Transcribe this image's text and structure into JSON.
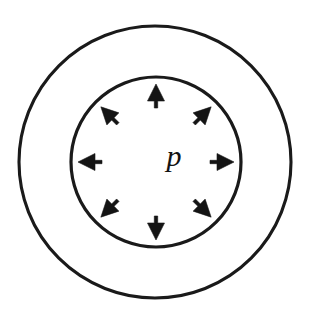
{
  "figure": {
    "kind": "diagram",
    "background_color": "#ffffff",
    "line_color": "#1a1a1a",
    "arrow_color": "#141414",
    "width": 310,
    "height": 314
  },
  "outer_circle": {
    "name": "outer wall boundary",
    "cx": 155,
    "cy": 162,
    "r": 136,
    "stroke_width": 3.1
  },
  "inner_circle": {
    "name": "inner bore boundary",
    "cx": 156,
    "cy": 162,
    "r": 85,
    "stroke_width": 3.2
  },
  "labels": [
    {
      "id": "pressure-symbol",
      "text": "p",
      "x": 174,
      "y": 166,
      "font_size": 30,
      "style": "italic-serif",
      "color": "#131313"
    }
  ],
  "arrows": {
    "count": 8,
    "direction": "radially outward",
    "meaning": "uniform internal pressure p acting on the bore wall",
    "tail_radius": 54,
    "tip_radius": 78,
    "head_length": 17,
    "head_half_width": 8.5,
    "tail_half_width": 1.7,
    "items": [
      {
        "id": "arrow-up",
        "angle_deg": 90,
        "points_toward": "up"
      },
      {
        "id": "arrow-up-right",
        "angle_deg": 45,
        "points_toward": "up-right"
      },
      {
        "id": "arrow-right",
        "angle_deg": 0,
        "points_toward": "right"
      },
      {
        "id": "arrow-down-right",
        "angle_deg": -45,
        "points_toward": "down-right"
      },
      {
        "id": "arrow-down",
        "angle_deg": -90,
        "points_toward": "down"
      },
      {
        "id": "arrow-down-left",
        "angle_deg": -135,
        "points_toward": "down-left"
      },
      {
        "id": "arrow-left",
        "angle_deg": 180,
        "points_toward": "left"
      },
      {
        "id": "arrow-up-left",
        "angle_deg": 135,
        "points_toward": "up-left"
      }
    ]
  }
}
